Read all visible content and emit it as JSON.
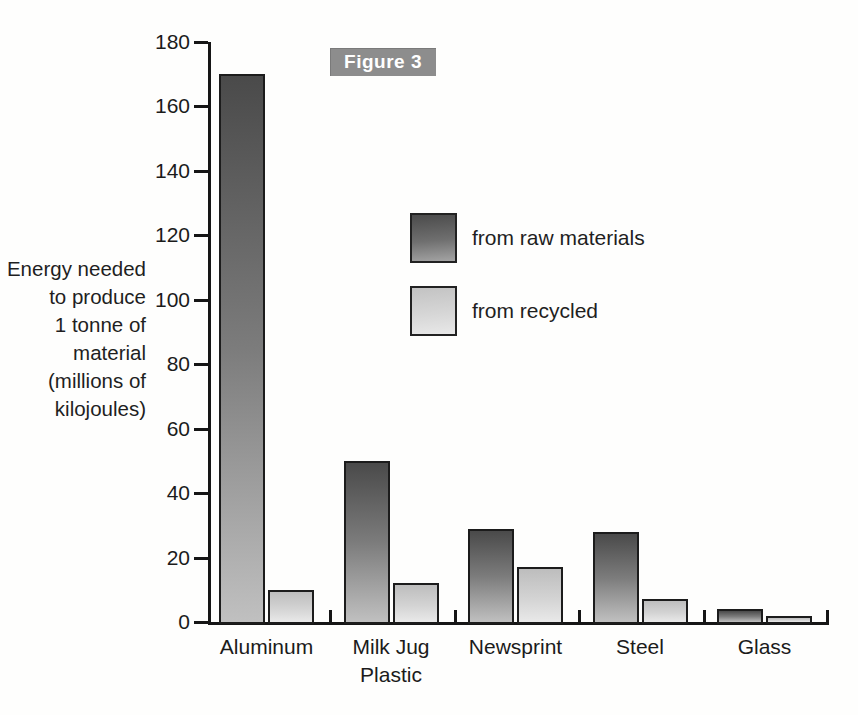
{
  "figure_badge": {
    "label": "Figure 3"
  },
  "chart_data": {
    "type": "bar",
    "title": "",
    "categories": [
      "Aluminum",
      "Milk Jug\nPlastic",
      "Newsprint",
      "Steel",
      "Glass"
    ],
    "series": [
      {
        "name": "from raw materials",
        "values": [
          170,
          50,
          29,
          28,
          4
        ]
      },
      {
        "name": "from recycled",
        "values": [
          10,
          12,
          17,
          7,
          2
        ]
      }
    ],
    "ylabel": "Energy needed to produce 1 tonne of material (millions of kilojoules)",
    "ylabel_lines": [
      "Energy needed",
      "to produce",
      "1 tonne of",
      "material",
      "(millions of",
      "kilojoules)"
    ],
    "xlabel": "",
    "ylim": [
      0,
      180
    ],
    "ytick_step": 20,
    "ytick_labels": [
      "0",
      "20",
      "40",
      "60",
      "80",
      "100",
      "120",
      "140",
      "160",
      "180"
    ],
    "grid": false,
    "legend_position": "center-right",
    "colors": {
      "raw_top": "#4a4a4a",
      "raw_bottom": "#c0c0c0",
      "recycled_top": "#bdbdbd",
      "recycled_bottom": "#e9e9e9",
      "axis": "#161616",
      "badge_bg": "#8d8d8d",
      "badge_text": "#ffffff"
    }
  }
}
